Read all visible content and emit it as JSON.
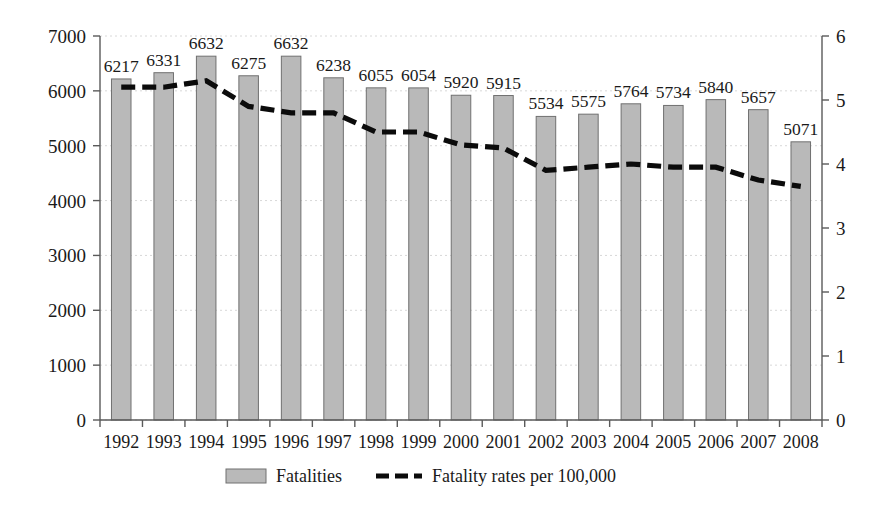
{
  "chart_data": {
    "type": "bar",
    "title": "",
    "subtitle": "",
    "xlabel": "",
    "ylabel": "",
    "y2label": "",
    "categories": [
      "1992",
      "1993",
      "1994",
      "1995",
      "1996",
      "1997",
      "1998",
      "1999",
      "2000",
      "2001",
      "2002",
      "2003",
      "2004",
      "2005",
      "2006",
      "2007",
      "2008"
    ],
    "series": [
      {
        "name": "Fatalities",
        "type": "bar",
        "axis": "left",
        "color": "#b9b9b9",
        "values": [
          6217,
          6331,
          6632,
          6275,
          6632,
          6238,
          6055,
          6054,
          5920,
          5915,
          5534,
          5575,
          5764,
          5734,
          5840,
          5657,
          5071
        ]
      },
      {
        "name": "Fatality rates per 100,000",
        "type": "line",
        "axis": "right",
        "color": "#0b0b0b",
        "values": [
          5.2,
          5.2,
          5.3,
          4.9,
          4.8,
          4.8,
          4.5,
          4.5,
          4.3,
          4.25,
          3.9,
          3.95,
          4.0,
          3.95,
          3.95,
          3.75,
          3.65
        ]
      }
    ],
    "ylim": [
      0,
      7000
    ],
    "yticks": [
      0,
      1000,
      2000,
      3000,
      4000,
      5000,
      6000,
      7000
    ],
    "ytick_labels": [
      "0",
      "1000",
      "2000",
      "3000",
      "4000",
      "5000",
      "6000",
      "7000"
    ],
    "y2lim": [
      0,
      6
    ],
    "y2ticks": [
      0,
      1,
      2,
      3,
      4,
      5,
      6
    ],
    "y2tick_labels": [
      "0",
      "1",
      "2",
      "3",
      "4",
      "5",
      "6"
    ],
    "grid": true,
    "data_labels": true,
    "legend_position": "bottom",
    "legend": [
      {
        "label": "Fatalities",
        "marker": "bar-swatch",
        "color": "#b9b9b9"
      },
      {
        "label": "Fatality rates per 100,000",
        "marker": "dashed-line",
        "color": "#0b0b0b"
      }
    ]
  }
}
